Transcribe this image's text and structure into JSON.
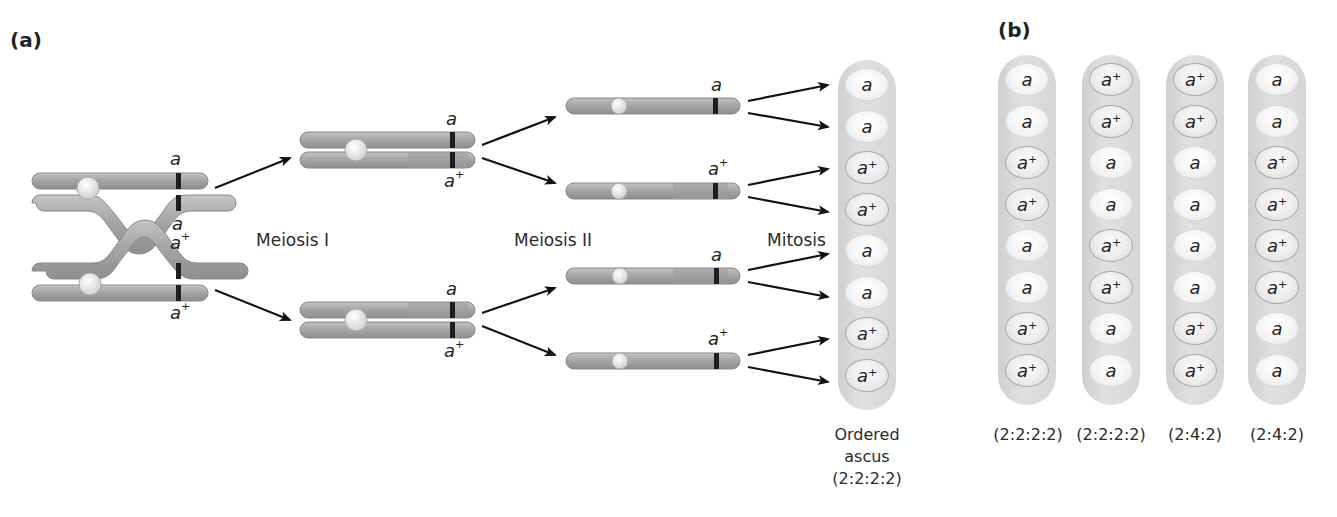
{
  "panels": {
    "a": {
      "label": "(a)",
      "stages": [
        "Meiosis I",
        "Meiosis II",
        "Mitosis"
      ],
      "allele_labels": {
        "start_top": "a",
        "start_cross_upper": "a",
        "start_cross_lower": "a",
        "start_cross_lower_sup": "+",
        "start_bottom": "a",
        "start_bottom_sup": "+",
        "m1_top_upper": "a",
        "m1_top_lower": "a",
        "m1_top_lower_sup": "+",
        "m1_bottom_upper": "a",
        "m1_bottom_lower": "a",
        "m1_bottom_lower_sup": "+",
        "m2_1": "a",
        "m2_2": "a",
        "m2_2_sup": "+",
        "m2_3": "a",
        "m2_4": "a",
        "m2_4_sup": "+"
      },
      "ascus": {
        "spores": [
          "a",
          "a",
          "a+",
          "a+",
          "a",
          "a",
          "a+",
          "a+"
        ],
        "caption_line1": "Ordered",
        "caption_line2": "ascus",
        "caption_line3": "(2:2:2:2)"
      }
    },
    "b": {
      "label": "(b)",
      "asci": [
        {
          "spores": [
            "a",
            "a",
            "a+",
            "a+",
            "a",
            "a",
            "a+",
            "a+"
          ],
          "caption": "(2:2:2:2)"
        },
        {
          "spores": [
            "a+",
            "a+",
            "a",
            "a",
            "a+",
            "a+",
            "a",
            "a"
          ],
          "caption": "(2:2:2:2)"
        },
        {
          "spores": [
            "a+",
            "a+",
            "a",
            "a",
            "a",
            "a",
            "a+",
            "a+"
          ],
          "caption": "(2:4:2)"
        },
        {
          "spores": [
            "a",
            "a",
            "a+",
            "a+",
            "a+",
            "a+",
            "a",
            "a"
          ],
          "caption": "(2:4:2)"
        }
      ]
    }
  },
  "colors": {
    "chromosome": "#a9a9a9",
    "chromosome_dark": "#8c8c8c",
    "centromere": "#e6e6e6",
    "locus_band": "#1e1e1e",
    "ascus_bg": "#d6d6d6",
    "arrow": "#111111"
  }
}
